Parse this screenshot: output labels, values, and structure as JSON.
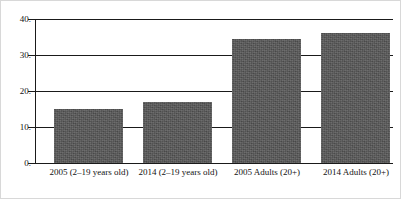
{
  "chart_data": {
    "type": "bar",
    "title": "",
    "subtitle": "",
    "xlabel": "",
    "ylabel": "",
    "categories": [
      "2005 (2–19 years old)",
      "2014 (2–19 years old)",
      "2005 Adults (20+)",
      "2014 Adults (20+)"
    ],
    "values": [
      15,
      17,
      34.5,
      36
    ],
    "ylim": [
      0,
      40
    ],
    "yticks": [
      0,
      10,
      20,
      30,
      40
    ],
    "ytick_labels": [
      "0.",
      "10.",
      "20.",
      "30.",
      "40."
    ],
    "grid": true,
    "grid_axis": "y",
    "legend": false,
    "legend_position": "none",
    "series": [
      {
        "name": "",
        "values": [
          15,
          17,
          34.5,
          36
        ]
      }
    ],
    "colors": {
      "bar_fill": "#565656",
      "axis": "#1a1a1a",
      "grid": "#1a1a1a",
      "text": "#121212",
      "background": "#ffffff",
      "frame": "#d8d8d8"
    }
  }
}
